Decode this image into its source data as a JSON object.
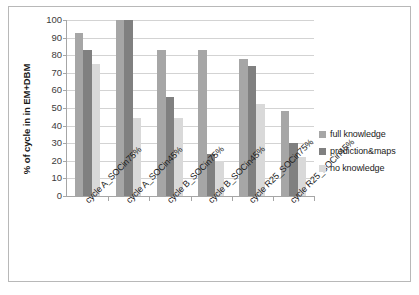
{
  "chart_data": {
    "type": "bar",
    "title": "",
    "subtitle": "",
    "xlabel": "",
    "ylabel": "% of cycle in in EM+DBM",
    "ylim": [
      0,
      100
    ],
    "yticks": [
      100,
      90,
      80,
      70,
      60,
      50,
      40,
      30,
      20,
      10,
      0
    ],
    "grid": true,
    "legend_position": "right",
    "categories": [
      "cycle A_SOCin75%",
      "cycle A_SOCin45%",
      "cycle B_SOCin75%",
      "cycle B_SOCin45%",
      "cycle R25_SOCin75%",
      "cycle R25_SOCin45%"
    ],
    "series": [
      {
        "name": "full knowledge",
        "color": "#a6a6a6",
        "values": [
          92.5,
          100,
          83,
          83,
          78,
          48.5
        ]
      },
      {
        "name": "prediction&maps",
        "color": "#808080",
        "values": [
          83,
          100,
          56.5,
          24,
          74,
          30
        ]
      },
      {
        "name": "no knowledge",
        "color": "#d9d9d9",
        "values": [
          75,
          44.5,
          44.5,
          20,
          52,
          22
        ]
      }
    ]
  },
  "colors": {
    "full_knowledge": "#a6a6a6",
    "prediction_maps": "#808080",
    "no_knowledge": "#d9d9d9",
    "gridline": "#d3d3d3",
    "axis": "#a6a6a6",
    "frame": "#b8b8b8",
    "text": "#1a1a1a",
    "tick_text": "#3b3b3b",
    "background": "#ffffff"
  }
}
